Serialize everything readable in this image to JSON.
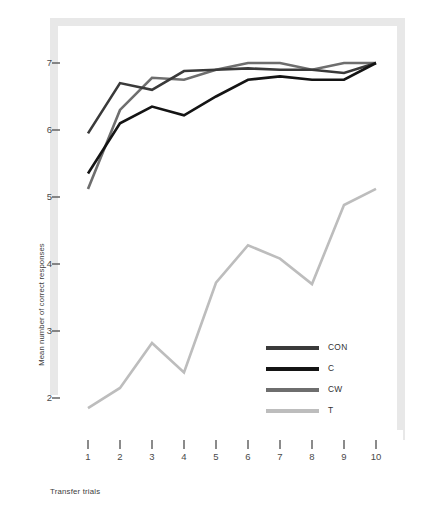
{
  "chart_data": {
    "type": "line",
    "title": "",
    "xlabel": "Transfer trials",
    "ylabel": "Mean number of correct responses",
    "x": [
      1,
      2,
      3,
      4,
      5,
      6,
      7,
      8,
      9,
      10
    ],
    "xticklabels": [
      "1",
      "2",
      "3",
      "4",
      "5",
      "6",
      "7",
      "8",
      "9",
      "10"
    ],
    "yticklabels": [
      "2",
      "3",
      "4",
      "5",
      "6",
      "7"
    ],
    "yticks": [
      2,
      3,
      4,
      5,
      6,
      7
    ],
    "xlim": [
      0.6,
      10.4
    ],
    "ylim": [
      1.45,
      7.35
    ],
    "grid": false,
    "legend_position": "lower-right",
    "series": [
      {
        "name": "CON",
        "color": "#3a3a3a",
        "values": [
          5.95,
          6.7,
          6.6,
          6.88,
          6.9,
          6.92,
          6.9,
          6.9,
          6.85,
          7.0
        ]
      },
      {
        "name": "C",
        "color": "#141414",
        "values": [
          5.35,
          6.1,
          6.35,
          6.22,
          6.5,
          6.75,
          6.8,
          6.75,
          6.75,
          7.0
        ]
      },
      {
        "name": "CW",
        "color": "#6e6e6e",
        "values": [
          5.12,
          6.3,
          6.78,
          6.75,
          6.9,
          7.0,
          7.0,
          6.9,
          7.0,
          7.0
        ]
      },
      {
        "name": "T",
        "color": "#bdbdbd",
        "values": [
          1.85,
          2.15,
          2.82,
          2.38,
          3.72,
          4.28,
          4.08,
          3.7,
          4.88,
          5.12
        ]
      }
    ]
  },
  "colors": {
    "frame": "#e8e8e8",
    "axis_tick": "#5a5a5a",
    "text": "#3c3c3c",
    "background": "#ffffff"
  }
}
